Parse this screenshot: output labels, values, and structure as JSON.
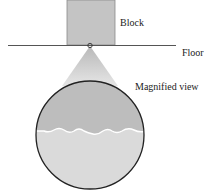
{
  "diagram": {
    "labels": {
      "block": "Block",
      "floor": "Floor",
      "magnified": "Magnified view"
    },
    "colors": {
      "block_fill": "#c4c4c4",
      "block_stroke": "#8a8a8a",
      "floor_line": "#555555",
      "cone_fill": "#cfcfcf",
      "upper_material": "#bdbdbd",
      "lower_material": "#dadada",
      "interface_highlight": "#ffffff",
      "circle_stroke": "#222222"
    }
  }
}
